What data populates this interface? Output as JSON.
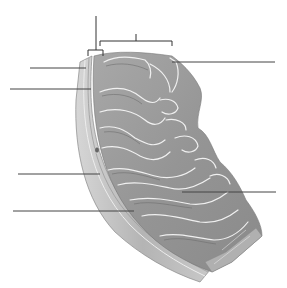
{
  "diagram": {
    "background": "#ffffff",
    "tissue_fill": "#9a9a9a",
    "tissue_dark": "#7c7c7c",
    "tissue_light": "#bdbdbd",
    "fold_highlight": "#f2f2f2",
    "line_color": "#444444",
    "label_lines": [
      {
        "id": "left-1",
        "x1": 30,
        "y1": 68,
        "x2": 86,
        "y2": 68
      },
      {
        "id": "left-2",
        "x1": 10,
        "y1": 89,
        "x2": 91,
        "y2": 89
      },
      {
        "id": "left-3",
        "x1": 18,
        "y1": 174,
        "x2": 100,
        "y2": 174
      },
      {
        "id": "left-4",
        "x1": 13,
        "y1": 211,
        "x2": 134,
        "y2": 211
      },
      {
        "id": "right-1",
        "x1": 172,
        "y1": 62,
        "x2": 275,
        "y2": 62
      },
      {
        "id": "right-2",
        "x1": 182,
        "y1": 192,
        "x2": 276,
        "y2": 192
      }
    ],
    "brackets": [
      {
        "id": "bracket-small",
        "x1": 88,
        "x2": 103,
        "y": 50,
        "stem_top": 16
      },
      {
        "id": "bracket-large",
        "x1": 100,
        "x2": 172,
        "y": 41,
        "stem_top": 34
      }
    ]
  }
}
